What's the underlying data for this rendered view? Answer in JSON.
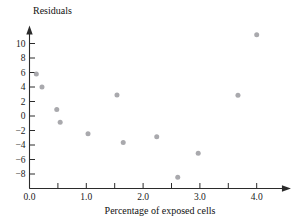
{
  "chart_data": {
    "type": "scatter",
    "title": "",
    "xlabel": "Percentage of exposed cells",
    "ylabel": "Residuals",
    "xlim": [
      -0.12,
      4.55
    ],
    "ylim": [
      -9.4,
      11.8
    ],
    "grid": false,
    "legend": null,
    "xticks": [
      0.0,
      0.5,
      1.0,
      1.5,
      2.0,
      2.5,
      3.0,
      3.5,
      4.0
    ],
    "xtick_labels": [
      "0.0",
      "",
      "1.0",
      "",
      "2.0",
      "",
      "3.0",
      "",
      "4.0"
    ],
    "yticks": [
      -8,
      -6,
      -4,
      -2,
      0,
      2,
      4,
      6,
      8,
      10
    ],
    "ytick_labels": [
      "−8",
      "−6",
      "−4",
      "−2",
      "0",
      "2",
      "4",
      "6",
      "8",
      "10"
    ],
    "point_color": "#a9a9ad",
    "axis_color": "#2b2b2b",
    "points": [
      {
        "x": 0.12,
        "y": 5.8
      },
      {
        "x": 0.22,
        "y": 4.0
      },
      {
        "x": 0.48,
        "y": 0.9
      },
      {
        "x": 0.54,
        "y": -0.85
      },
      {
        "x": 1.03,
        "y": -2.45
      },
      {
        "x": 1.54,
        "y": 2.9
      },
      {
        "x": 1.65,
        "y": -3.65
      },
      {
        "x": 2.24,
        "y": -2.85
      },
      {
        "x": 2.61,
        "y": -8.45
      },
      {
        "x": 2.97,
        "y": -5.15
      },
      {
        "x": 3.67,
        "y": 2.85
      },
      {
        "x": 4.0,
        "y": 11.2
      }
    ]
  },
  "labels": {
    "y_axis_title": "Residuals",
    "x_axis_title": "Percentage of exposed cells"
  }
}
